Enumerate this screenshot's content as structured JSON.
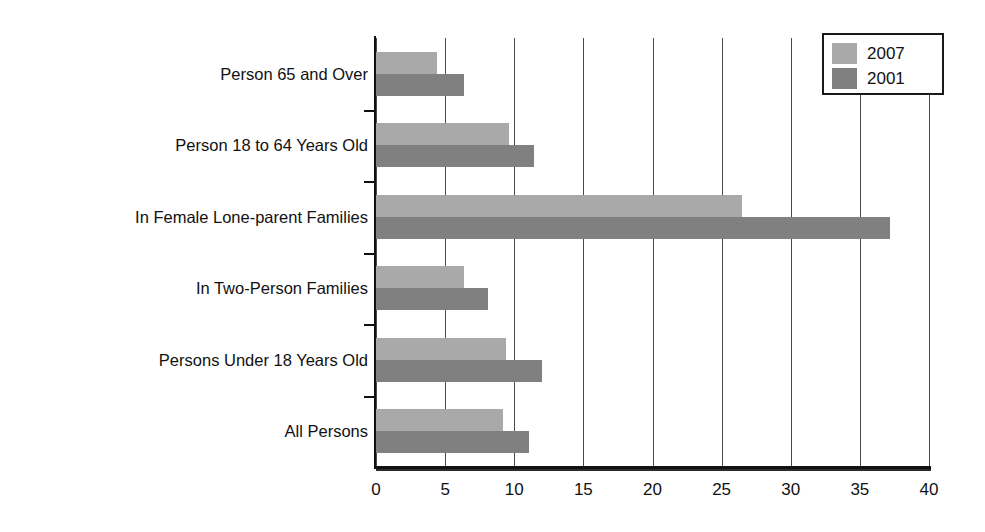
{
  "chart_data": {
    "type": "bar",
    "orientation": "horizontal",
    "title": "",
    "subtitle": "",
    "xlabel": "",
    "ylabel": "",
    "xlim": [
      0,
      40
    ],
    "xticks": [
      "0",
      "5",
      "10",
      "15",
      "20",
      "25",
      "30",
      "35",
      "40"
    ],
    "grid": true,
    "grid_axis": "x",
    "legend_position": "top-right",
    "categories": [
      "Person 65 and Over",
      "Person 18 to 64 Years Old",
      "In Female Lone-parent Families",
      "In Two-Person Families",
      "Persons Under 18 Years Old",
      "All Persons"
    ],
    "series": [
      {
        "name": "2007",
        "color": "#a9a9a9",
        "values": [
          4.4,
          9.6,
          26.5,
          6.4,
          9.4,
          9.2
        ]
      },
      {
        "name": "2001",
        "color": "#808080",
        "values": [
          6.4,
          11.4,
          37.2,
          8.1,
          12.0,
          11.1
        ]
      }
    ]
  },
  "legend": {
    "entries": [
      {
        "label": "2007",
        "color": "#a9a9a9"
      },
      {
        "label": "2001",
        "color": "#808080"
      }
    ]
  },
  "axis": {
    "x_tick_labels": [
      "0",
      "5",
      "10",
      "15",
      "20",
      "25",
      "30",
      "35",
      "40"
    ],
    "y_tick_labels": [
      "Person 65 and Over",
      "Person 18 to 64 Years Old",
      "In Female Lone-parent Families",
      "In Two-Person Families",
      "Persons Under 18 Years Old",
      "All Persons"
    ]
  },
  "colors": {
    "series_2007": "#a9a9a9",
    "series_2001": "#808080",
    "axis": "#111111",
    "gridline": "#4a4a4a",
    "background": "#ffffff"
  }
}
